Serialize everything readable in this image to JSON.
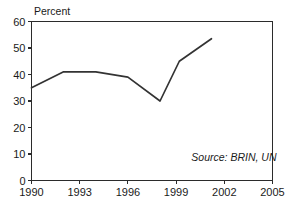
{
  "chart_data": {
    "type": "line",
    "title": "",
    "subtitle": "",
    "xlabel": "",
    "ylabel": "Percent",
    "xlim": [
      1990,
      2005
    ],
    "ylim": [
      0,
      60
    ],
    "grid": false,
    "legend": false,
    "x_ticks": [
      "1990",
      "1993",
      "1996",
      "1999",
      "2002",
      "2005"
    ],
    "x_tick_values": [
      1990,
      1993,
      1996,
      1999,
      2002,
      2005
    ],
    "y_ticks": [
      "0",
      "10",
      "20",
      "30",
      "40",
      "50",
      "60"
    ],
    "y_tick_values": [
      0,
      10,
      20,
      30,
      40,
      50,
      60
    ],
    "series": [
      {
        "name": "Percent",
        "x": [
          1990,
          1992,
          1994,
          1996,
          1998,
          1999.2,
          2001.2
        ],
        "values": [
          35,
          41,
          41,
          39,
          30,
          45,
          53.5
        ]
      }
    ],
    "annotations": [
      {
        "name": "source-note",
        "text": "Source: BRIN, UN",
        "x": 2002.6,
        "y": 7.5,
        "style": "italic",
        "anchor": "middle"
      }
    ],
    "colors": {
      "line": "#333333",
      "axis": "#2b2b2b",
      "background": "#ffffff",
      "text": "#1a1a1a"
    }
  }
}
